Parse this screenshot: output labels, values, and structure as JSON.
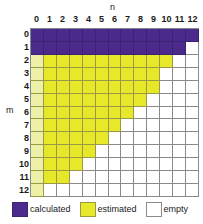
{
  "chart_data": {
    "type": "heatmap",
    "title": "",
    "xlabel": "n",
    "ylabel": "m",
    "x_tick_labels": [
      "0",
      "1",
      "2",
      "3",
      "4",
      "5",
      "6",
      "7",
      "8",
      "9",
      "10",
      "11",
      "12"
    ],
    "y_tick_labels": [
      "0",
      "1",
      "2",
      "3",
      "4",
      "5",
      "6",
      "7",
      "8",
      "9",
      "10",
      "11",
      "12"
    ],
    "xlim": [
      0,
      12
    ],
    "ylim": [
      0,
      12
    ],
    "grid": true,
    "legend_position": "bottom",
    "categories": [
      "calculated",
      "estimated",
      "empty"
    ],
    "category_colors": {
      "calculated": "#4b2a8c",
      "estimated": "#e8e82a",
      "empty": "#ffffff"
    },
    "grid_line_color": "#8a8a8a",
    "row_max_estimated_n": [
      -1,
      -1,
      10,
      9,
      9,
      8,
      7,
      6,
      5,
      4,
      3,
      2,
      0
    ],
    "row_max_calculated_n": [
      12,
      11,
      -1,
      -1,
      -1,
      -1,
      -1,
      -1,
      -1,
      -1,
      -1,
      -1,
      -1
    ],
    "cells": [
      [
        "calculated",
        "calculated",
        "calculated",
        "calculated",
        "calculated",
        "calculated",
        "calculated",
        "calculated",
        "calculated",
        "calculated",
        "calculated",
        "calculated",
        "calculated"
      ],
      [
        "calculated",
        "calculated",
        "calculated",
        "calculated",
        "calculated",
        "calculated",
        "calculated",
        "calculated",
        "calculated",
        "calculated",
        "calculated",
        "calculated",
        "empty"
      ],
      [
        "estimated",
        "estimated",
        "estimated",
        "estimated",
        "estimated",
        "estimated",
        "estimated",
        "estimated",
        "estimated",
        "estimated",
        "estimated",
        "empty",
        "empty"
      ],
      [
        "estimated",
        "estimated",
        "estimated",
        "estimated",
        "estimated",
        "estimated",
        "estimated",
        "estimated",
        "estimated",
        "estimated",
        "empty",
        "empty",
        "empty"
      ],
      [
        "estimated",
        "estimated",
        "estimated",
        "estimated",
        "estimated",
        "estimated",
        "estimated",
        "estimated",
        "estimated",
        "estimated",
        "empty",
        "empty",
        "empty"
      ],
      [
        "estimated",
        "estimated",
        "estimated",
        "estimated",
        "estimated",
        "estimated",
        "estimated",
        "estimated",
        "estimated",
        "empty",
        "empty",
        "empty",
        "empty"
      ],
      [
        "estimated",
        "estimated",
        "estimated",
        "estimated",
        "estimated",
        "estimated",
        "estimated",
        "estimated",
        "empty",
        "empty",
        "empty",
        "empty",
        "empty"
      ],
      [
        "estimated",
        "estimated",
        "estimated",
        "estimated",
        "estimated",
        "estimated",
        "estimated",
        "empty",
        "empty",
        "empty",
        "empty",
        "empty",
        "empty"
      ],
      [
        "estimated",
        "estimated",
        "estimated",
        "estimated",
        "estimated",
        "estimated",
        "empty",
        "empty",
        "empty",
        "empty",
        "empty",
        "empty",
        "empty"
      ],
      [
        "estimated",
        "estimated",
        "estimated",
        "estimated",
        "estimated",
        "empty",
        "empty",
        "empty",
        "empty",
        "empty",
        "empty",
        "empty",
        "empty"
      ],
      [
        "estimated",
        "estimated",
        "estimated",
        "estimated",
        "empty",
        "empty",
        "empty",
        "empty",
        "empty",
        "empty",
        "empty",
        "empty",
        "empty"
      ],
      [
        "estimated",
        "estimated",
        "estimated",
        "empty",
        "empty",
        "empty",
        "empty",
        "empty",
        "empty",
        "empty",
        "empty",
        "empty",
        "empty"
      ],
      [
        "estimated",
        "empty",
        "empty",
        "empty",
        "empty",
        "empty",
        "empty",
        "empty",
        "empty",
        "empty",
        "empty",
        "empty",
        "empty"
      ]
    ]
  },
  "legend": {
    "items": [
      {
        "label": "calculated",
        "key": "calculated"
      },
      {
        "label": "estimated",
        "key": "estimated"
      },
      {
        "label": "empty",
        "key": "empty"
      }
    ]
  }
}
